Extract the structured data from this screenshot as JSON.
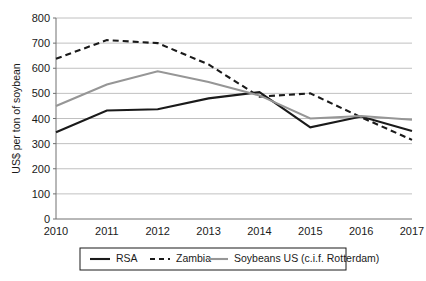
{
  "chart_data": {
    "type": "line",
    "title": "",
    "xlabel": "",
    "ylabel": "US$ per ton of soybean",
    "categories": [
      "2010",
      "2011",
      "2012",
      "2013",
      "2014",
      "2015",
      "2016",
      "2017"
    ],
    "x": [
      2010,
      2011,
      2012,
      2013,
      2014,
      2015,
      2016,
      2017
    ],
    "ylim": [
      0,
      800
    ],
    "yticks": [
      0,
      100,
      200,
      300,
      400,
      500,
      600,
      700,
      800
    ],
    "ytick_labels": [
      "0",
      "100",
      "200",
      "300",
      "400",
      "500",
      "600",
      "700",
      "800"
    ],
    "grid": true,
    "legend_position": "bottom",
    "series": [
      {
        "name": "RSA",
        "style": "solid",
        "color": "#1a1a1a",
        "values": [
          345,
          432,
          437,
          480,
          505,
          365,
          408,
          350
        ]
      },
      {
        "name": "Zambia",
        "style": "dashed",
        "color": "#1a1a1a",
        "values": [
          638,
          712,
          700,
          615,
          487,
          500,
          405,
          315
        ]
      },
      {
        "name": "Soybeans US (c.i.f. Rotterdam)",
        "style": "solid",
        "color": "#969696",
        "values": [
          450,
          535,
          588,
          545,
          492,
          400,
          410,
          395
        ]
      }
    ]
  },
  "legend": {
    "items": [
      {
        "label": "RSA"
      },
      {
        "label": "Zambia"
      },
      {
        "label": "Soybeans US (c.i.f. Rotterdam)"
      }
    ]
  },
  "colors": {
    "series_dark": "#1a1a1a",
    "series_gray": "#969696",
    "gridline": "#b0b0b0",
    "axis": "#707070",
    "background": "#ffffff"
  }
}
